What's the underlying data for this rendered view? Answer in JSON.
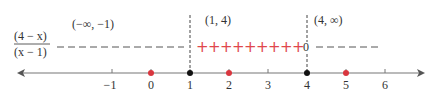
{
  "expression": {
    "numerator": "(4 − x)",
    "denominator": "(x − 1)"
  },
  "intervals": [
    {
      "label": "(−∞, −1)",
      "sign": "−",
      "sign_count": 12
    },
    {
      "label": "(1, 4)",
      "sign": "+",
      "sign_count": 9
    },
    {
      "label": "(4, ∞)",
      "sign": "−",
      "sign_count": 6
    }
  ],
  "zero_marker": "0",
  "number_line": {
    "ticks": [
      "−1",
      "0",
      "1",
      "2",
      "3",
      "4",
      "5",
      "6"
    ],
    "critical_points": [
      "1",
      "4"
    ],
    "test_points": [
      "0",
      "2",
      "5"
    ]
  },
  "colors": {
    "positive_sign": "#e0474c",
    "test_point": "#d9363e",
    "critical_point": "#111111",
    "axis": "#666666",
    "negative_sign": "#555555"
  }
}
